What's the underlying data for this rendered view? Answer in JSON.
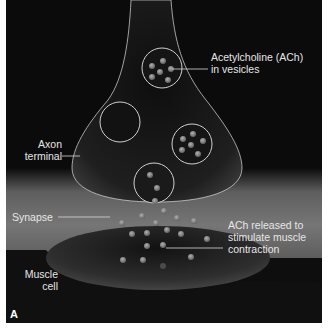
{
  "figure": {
    "panel_label": "A",
    "labels": {
      "ach_vesicles": {
        "line1": "Acetylcholine (ACh)",
        "line2": "in vesicles"
      },
      "axon_terminal": {
        "line1": "Axon",
        "line2": "terminal"
      },
      "synapse": {
        "text": "Synapse"
      },
      "ach_released": {
        "line1": "ACh released to",
        "line2": "stimulate muscle",
        "line3": "contraction"
      },
      "muscle_cell": {
        "line1": "Muscle",
        "line2": "cell"
      }
    },
    "colors": {
      "background": "#0b0b0b",
      "synapse_band": "#6e6e6e",
      "muscle_cell": "#2a2a2a",
      "axon_fill": "#1c1c1c",
      "membrane_outline": "#d8d8d8",
      "ach_molecule": "#8a8a8a",
      "label_text": "#e6e6e6"
    }
  }
}
